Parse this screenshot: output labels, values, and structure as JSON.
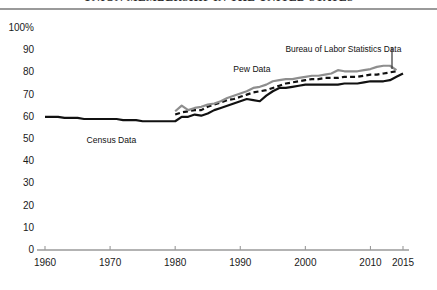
{
  "title": "UNION MEMBERSHIP IN THE UNITED STATES",
  "chart_data": {
    "type": "line",
    "title": "UNION MEMBERSHIP IN THE UNITED STATES",
    "xlabel": "",
    "ylabel": "",
    "xlim": [
      1960,
      2015
    ],
    "ylim": [
      0,
      100
    ],
    "grid": false,
    "legend_position": "inline-annotations",
    "y_ticks": [
      "100%",
      "90",
      "80",
      "70",
      "60",
      "50",
      "40",
      "30",
      "20",
      "10",
      "0"
    ],
    "y_tick_values": [
      100,
      90,
      80,
      70,
      60,
      50,
      40,
      30,
      20,
      10,
      0
    ],
    "x_ticks": [
      "1960",
      "1970",
      "1980",
      "1990",
      "2000",
      "2010",
      "2015"
    ],
    "x_tick_values": [
      1960,
      1970,
      1980,
      1990,
      2000,
      2010,
      2015
    ],
    "annotations": [
      {
        "text": "Census Data",
        "x": 1971,
        "y": 52
      },
      {
        "text": "Pew Data",
        "x": 1992,
        "y": 84
      },
      {
        "text": "Bureau of Labor Statistics Data",
        "x": 2008,
        "y": 93
      }
    ],
    "series": [
      {
        "name": "Census Data",
        "style": "solid",
        "color": "#111111",
        "width": 2.2,
        "x": [
          1960,
          1961,
          1962,
          1963,
          1964,
          1965,
          1966,
          1967,
          1968,
          1969,
          1970,
          1971,
          1972,
          1973,
          1974,
          1975,
          1976,
          1977,
          1978,
          1979,
          1980,
          1981,
          1982,
          1983,
          1984,
          1985,
          1986,
          1987,
          1988,
          1989,
          1990,
          1991,
          1992,
          1993,
          1994,
          1995,
          1996,
          1997,
          1998,
          1999,
          2000,
          2001,
          2002,
          2003,
          2004,
          2005,
          2006,
          2007,
          2008,
          2009,
          2010,
          2011,
          2012,
          2013,
          2014,
          2015
        ],
        "values": [
          60,
          60,
          60,
          59.5,
          59.5,
          59.5,
          59,
          59,
          59,
          59,
          59,
          59,
          58.5,
          58.5,
          58.5,
          58,
          58,
          58,
          58,
          58,
          58,
          60,
          60,
          61,
          60.5,
          61.5,
          63,
          64,
          65,
          66,
          67,
          68,
          67.5,
          67,
          69.5,
          71.5,
          73,
          73,
          73.5,
          74,
          74.5,
          74.5,
          74.5,
          74.5,
          74.5,
          74.5,
          75,
          75,
          75,
          75.5,
          76,
          76,
          76,
          76.5,
          78,
          79.5
        ]
      },
      {
        "name": "Bureau of Labor Statistics Data",
        "style": "dashed",
        "color": "#111111",
        "width": 2.2,
        "x": [
          1980,
          1981,
          1982,
          1983,
          1984,
          1985,
          1986,
          1987,
          1988,
          1989,
          1990,
          1991,
          1992,
          1993,
          1994,
          1995,
          1996,
          1997,
          1998,
          1999,
          2000,
          2001,
          2002,
          2003,
          2004,
          2005,
          2006,
          2007,
          2008,
          2009,
          2010,
          2011,
          2012,
          2013,
          2014
        ],
        "values": [
          61,
          62,
          62.5,
          63,
          63,
          64.5,
          65.5,
          66.5,
          67.5,
          68,
          69,
          70,
          71,
          71.5,
          72,
          73,
          74,
          75,
          75.5,
          76,
          76.5,
          77,
          77,
          77.5,
          77.5,
          77.5,
          78,
          78,
          78,
          78.5,
          79,
          79,
          79.5,
          80,
          80.5
        ]
      },
      {
        "name": "Pew Data",
        "style": "solid",
        "color": "#8e8e8e",
        "width": 2.2,
        "x": [
          1980,
          1981,
          1982,
          1983,
          1984,
          1985,
          1986,
          1987,
          1988,
          1989,
          1990,
          1991,
          1992,
          1993,
          1994,
          1995,
          1996,
          1997,
          1998,
          1999,
          2000,
          2001,
          2002,
          2003,
          2004,
          2005,
          2006,
          2007,
          2008,
          2009,
          2010,
          2011,
          2012,
          2013,
          2014
        ],
        "values": [
          62.5,
          65,
          63,
          64,
          64.5,
          65.5,
          66,
          67,
          68.5,
          69.5,
          70.5,
          71.5,
          73,
          73.5,
          74.5,
          76,
          76.5,
          77,
          77,
          77.5,
          78,
          78.5,
          78.5,
          79,
          79.5,
          81,
          80.5,
          80.5,
          80.5,
          81,
          81.5,
          82.5,
          83,
          83,
          81
        ]
      }
    ]
  }
}
